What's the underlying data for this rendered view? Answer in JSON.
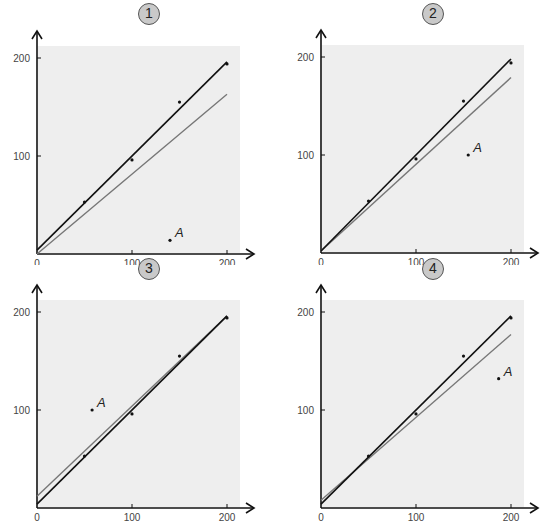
{
  "chart_data": [
    {
      "type": "scatter",
      "title": "1",
      "xlabel": "",
      "ylabel": "",
      "xlim": [
        0,
        210
      ],
      "ylim": [
        0,
        210
      ],
      "xticks": [
        "0",
        "100",
        "200"
      ],
      "yticks": [
        "100",
        "200"
      ],
      "grid": false,
      "points": [
        [
          50,
          53
        ],
        [
          100,
          96
        ],
        [
          150,
          155
        ],
        [
          200,
          194
        ]
      ],
      "special_point": {
        "label": "A",
        "x": 140,
        "y": 14
      },
      "series": [
        {
          "name": "fit without A",
          "color": "#111111",
          "intercept": 4,
          "slope": 0.96
        },
        {
          "name": "fit with A",
          "color": "#777777",
          "intercept": 0,
          "slope": 0.815
        }
      ]
    },
    {
      "type": "scatter",
      "title": "2",
      "xlabel": "",
      "ylabel": "",
      "xlim": [
        0,
        210
      ],
      "ylim": [
        0,
        210
      ],
      "xticks": [
        "0",
        "100",
        "200"
      ],
      "yticks": [
        "100",
        "200"
      ],
      "grid": false,
      "points": [
        [
          50,
          53
        ],
        [
          100,
          96
        ],
        [
          150,
          155
        ],
        [
          200,
          194
        ]
      ],
      "special_point": {
        "label": "A",
        "x": 155,
        "y": 100
      },
      "series": [
        {
          "name": "fit without A",
          "color": "#111111",
          "intercept": 2,
          "slope": 0.98
        },
        {
          "name": "fit with A",
          "color": "#777777",
          "intercept": 2,
          "slope": 0.885
        }
      ]
    },
    {
      "type": "scatter",
      "title": "3",
      "xlabel": "",
      "ylabel": "",
      "xlim": [
        0,
        210
      ],
      "ylim": [
        0,
        210
      ],
      "xticks": [
        "0",
        "100",
        "200"
      ],
      "yticks": [
        "100",
        "200"
      ],
      "grid": false,
      "points": [
        [
          50,
          53
        ],
        [
          100,
          96
        ],
        [
          150,
          155
        ],
        [
          200,
          194
        ]
      ],
      "special_point": {
        "label": "A",
        "x": 58,
        "y": 100
      },
      "series": [
        {
          "name": "fit without A",
          "color": "#111111",
          "intercept": 4,
          "slope": 0.96
        },
        {
          "name": "fit with A",
          "color": "#777777",
          "intercept": 12,
          "slope": 0.92
        }
      ]
    },
    {
      "type": "scatter",
      "title": "4",
      "xlabel": "",
      "ylabel": "",
      "xlim": [
        0,
        210
      ],
      "ylim": [
        0,
        210
      ],
      "xticks": [
        "0",
        "100",
        "200"
      ],
      "yticks": [
        "100",
        "200"
      ],
      "grid": false,
      "points": [
        [
          50,
          53
        ],
        [
          100,
          96
        ],
        [
          150,
          155
        ],
        [
          200,
          194
        ]
      ],
      "special_point": {
        "label": "A",
        "x": 187,
        "y": 132
      },
      "series": [
        {
          "name": "fit without A",
          "color": "#111111",
          "intercept": 4,
          "slope": 0.96
        },
        {
          "name": "fit with A",
          "color": "#777777",
          "intercept": 8,
          "slope": 0.845
        }
      ]
    }
  ]
}
